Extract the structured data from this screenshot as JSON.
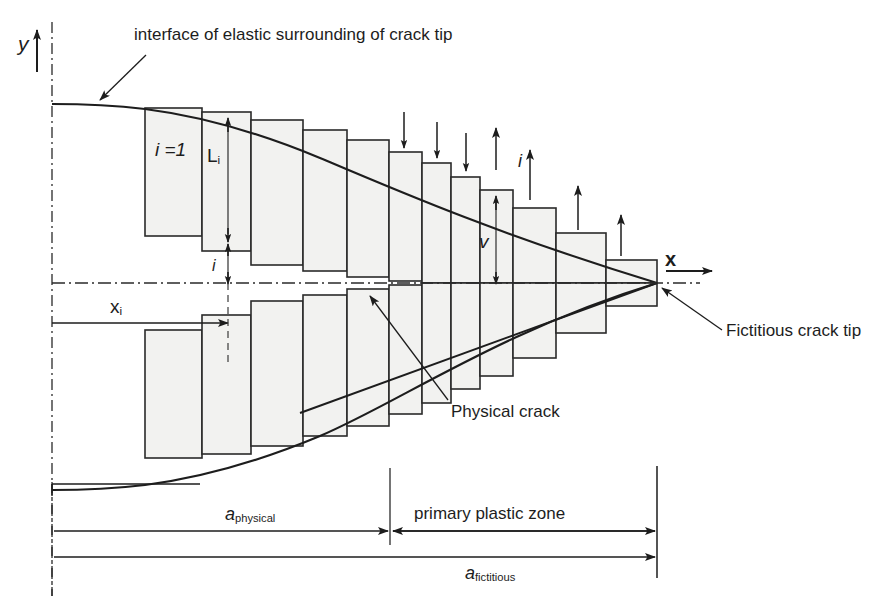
{
  "figure": {
    "type": "technical-diagram",
    "axes": {
      "y_label": "y",
      "x_label": "x"
    },
    "annotations": {
      "interface": "interface of elastic surrounding of crack tip",
      "first_element": "i =1",
      "element_length": "L",
      "element_length_sub": "i",
      "element_index": "i",
      "coordinate": "x",
      "coordinate_sub": "i",
      "opening": "v",
      "index_small": "i",
      "physical_crack": "Physical crack",
      "fictitious_tip": "Fictitious crack tip",
      "primary_plastic_zone": "primary plastic zone",
      "a_physical_main": "a",
      "a_physical_sub": "physical",
      "a_fictitious_main": "a",
      "a_fictitious_sub": "fictitious"
    },
    "colors": {
      "line": "#1d1d1d",
      "bar_fill": "#f2f2f0",
      "bar_stroke": "#2a2a2a",
      "axis": "#2a2a2a",
      "text": "#1d1d1d"
    },
    "geometry": {
      "origin_x": 52,
      "centerline_y": 283,
      "tip_x": 657,
      "physical_crack_x": 390,
      "upper_bars": [
        {
          "x": 145,
          "w": 57,
          "top": 108,
          "bottom": 236
        },
        {
          "x": 202,
          "w": 49,
          "top": 112,
          "bottom": 251
        },
        {
          "x": 251,
          "w": 52,
          "top": 120,
          "bottom": 265
        },
        {
          "x": 303,
          "w": 44,
          "top": 130,
          "bottom": 271
        },
        {
          "x": 347,
          "w": 42,
          "top": 140,
          "bottom": 277
        },
        {
          "x": 389,
          "w": 33,
          "top": 152,
          "bottom": 281
        },
        {
          "x": 422,
          "w": 29,
          "top": 163,
          "bottom": 283
        },
        {
          "x": 451,
          "w": 29,
          "top": 177,
          "bottom": 283
        },
        {
          "x": 480,
          "w": 33,
          "top": 190,
          "bottom": 283
        },
        {
          "x": 513,
          "w": 43,
          "top": 208,
          "bottom": 283
        },
        {
          "x": 556,
          "w": 50,
          "top": 233,
          "bottom": 283
        },
        {
          "x": 606,
          "w": 51,
          "top": 260,
          "bottom": 283
        }
      ],
      "dimension_rows": [
        {
          "y": 490,
          "name": "tick-row"
        },
        {
          "y": 531,
          "name": "a-physical-row"
        },
        {
          "y": 557,
          "name": "a-fictitious-row"
        }
      ]
    }
  }
}
